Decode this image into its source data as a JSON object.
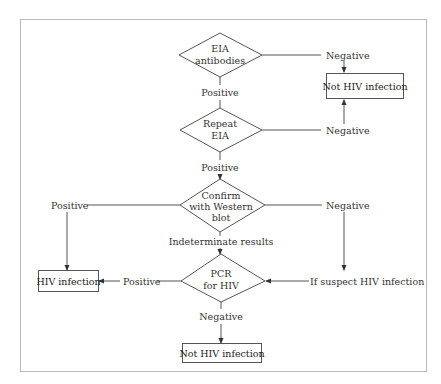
{
  "flowchart": {
    "nodes": {
      "eia": {
        "line1": "EIA",
        "line2": "antibodies"
      },
      "repeat": {
        "line1": "Repeat",
        "line2": "EIA"
      },
      "confirm": {
        "line1": "Confirm",
        "line2": "with Western",
        "line3": "blot"
      },
      "pcr": {
        "line1": "PCR",
        "line2": "for HIV"
      },
      "not_hiv_top": {
        "label": "Not HIV infection"
      },
      "hiv_infection": {
        "label": "HIV infection"
      },
      "not_hiv_bottom": {
        "label": "Not HIV infection"
      }
    },
    "edge_labels": {
      "eia_negative": "Negative",
      "eia_positive": "Positive",
      "repeat_negative": "Negative",
      "repeat_positive": "Positive",
      "confirm_positive": "Positive",
      "confirm_negative": "Negative",
      "confirm_indeterminate": "Indeterminate results",
      "pcr_positive": "Positive",
      "pcr_negative": "Negative",
      "suspect": "If suspect HIV infection"
    }
  },
  "colors": {
    "frame": "#b9b9b9",
    "stroke": "#555555",
    "text": "#333333"
  }
}
